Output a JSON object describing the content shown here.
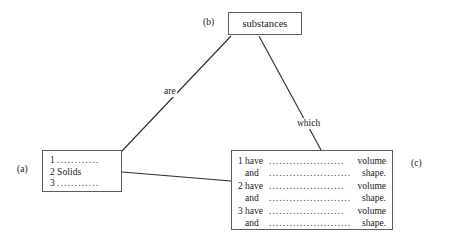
{
  "diagram": {
    "type": "concept-map",
    "nodes": {
      "substances": {
        "ref": "(b)",
        "title": "substances"
      },
      "list": {
        "ref": "(a)",
        "items": [
          {
            "num": "1",
            "text": "",
            "dots": "............"
          },
          {
            "num": "2",
            "text": "Solids",
            "dots": ""
          },
          {
            "num": "3",
            "text": "",
            "dots": "............"
          }
        ]
      },
      "properties": {
        "ref": "(c)",
        "groups": [
          {
            "num": "1",
            "lines": [
              {
                "verb": "have",
                "dots": "........................",
                "tail": "volume"
              },
              {
                "verb": "and",
                "dots": "..........................",
                "tail": "shape."
              }
            ]
          },
          {
            "num": "2",
            "lines": [
              {
                "verb": "have",
                "dots": "........................",
                "tail": "volume"
              },
              {
                "verb": "and",
                "dots": "..........................",
                "tail": "shape."
              }
            ]
          },
          {
            "num": "3",
            "lines": [
              {
                "verb": "have",
                "dots": "........................",
                "tail": "volume"
              },
              {
                "verb": "and",
                "dots": "..........................",
                "tail": "shape."
              }
            ]
          }
        ]
      }
    },
    "edges": [
      {
        "from": "substances",
        "to": "list",
        "label": "are"
      },
      {
        "from": "substances",
        "to": "properties",
        "label": "which"
      },
      {
        "from": "list",
        "to": "properties",
        "label": ""
      }
    ],
    "colors": {
      "background": "#ffffff",
      "border": "#5d5d5d",
      "line": "#2b2b2b",
      "text": "#1a1a1a"
    }
  }
}
